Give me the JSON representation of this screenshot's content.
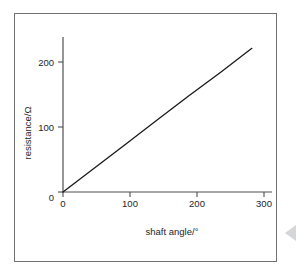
{
  "figure": {
    "background_color": "#ffffff",
    "frame_color": "#6f7275",
    "line_color": "#18191b",
    "axis_color": "#4c4f52",
    "decoration": {
      "arrow_icon": "left-triangle-icon",
      "arrow_color": "#d4d6d8"
    }
  },
  "chart_data": {
    "type": "line",
    "title": "",
    "subtitle": "",
    "xlabel": "shaft angle/°",
    "ylabel": "resistance/Ω",
    "xlim": [
      0,
      332
    ],
    "ylim": [
      0,
      232
    ],
    "xticks": [
      0,
      100,
      200,
      300
    ],
    "xticklabels": [
      "0",
      "100",
      "200",
      "300"
    ],
    "yticks": [
      0,
      100,
      200
    ],
    "yticklabels": [
      "0",
      "100",
      "200"
    ],
    "grid": false,
    "legend": null,
    "annotations": [],
    "series": [
      {
        "name": "resistance vs shaft angle",
        "color": "#18191b",
        "x": [
          0,
          50,
          100,
          150,
          200,
          250,
          300
        ],
        "y": [
          0,
          36,
          72,
          108,
          144,
          179,
          215
        ]
      }
    ],
    "slope_ohm_per_degree": 0.717,
    "intercept_ohm": 0
  }
}
